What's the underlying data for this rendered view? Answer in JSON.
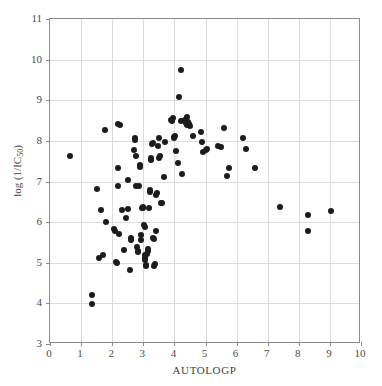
{
  "chart_data": {
    "type": "scatter",
    "title": "",
    "xlabel": "AUTOLOGP",
    "ylabel": "log (1/IC50)",
    "ylabel_base": "log (1/IC",
    "ylabel_sub": "50",
    "ylabel_close": ")",
    "xlim": [
      0,
      10
    ],
    "ylim": [
      3,
      11
    ],
    "xticks": [
      0,
      1,
      2,
      3,
      4,
      5,
      6,
      7,
      8,
      9,
      10
    ],
    "yticks": [
      3,
      4,
      5,
      6,
      7,
      8,
      9,
      10,
      11
    ],
    "xtick_labels": [
      "0",
      "1",
      "2",
      "3",
      "4",
      "5",
      "6",
      "7",
      "8",
      "9",
      "10"
    ],
    "ytick_labels": [
      "3",
      "4",
      "5",
      "6",
      "7",
      "8",
      "9",
      "10",
      "11"
    ],
    "grid": true,
    "legend": null,
    "marker": "filled-circle",
    "marker_color": "#1c1c1c",
    "marker_size": 6,
    "grid_color": "#dcdcdc",
    "frame_color": "#8c8c8c",
    "background": "#ffffff",
    "n_points": 118,
    "points": [
      [
        0.64,
        7.64
      ],
      [
        1.35,
        4.2
      ],
      [
        1.35,
        3.98
      ],
      [
        1.5,
        6.82
      ],
      [
        1.58,
        5.12
      ],
      [
        1.65,
        6.3
      ],
      [
        1.72,
        5.2
      ],
      [
        1.78,
        8.28
      ],
      [
        1.8,
        6.0
      ],
      [
        2.05,
        5.83
      ],
      [
        2.08,
        5.78
      ],
      [
        2.12,
        5.02
      ],
      [
        2.15,
        5.0
      ],
      [
        2.18,
        8.42
      ],
      [
        2.18,
        7.34
      ],
      [
        2.2,
        6.9
      ],
      [
        2.22,
        5.7
      ],
      [
        2.25,
        8.4
      ],
      [
        2.32,
        6.3
      ],
      [
        2.38,
        5.32
      ],
      [
        2.45,
        6.1
      ],
      [
        2.5,
        7.04
      ],
      [
        2.52,
        6.32
      ],
      [
        2.56,
        4.82
      ],
      [
        2.6,
        5.62
      ],
      [
        2.62,
        5.55
      ],
      [
        2.7,
        7.78
      ],
      [
        2.72,
        8.08
      ],
      [
        2.74,
        8.02
      ],
      [
        2.76,
        7.63
      ],
      [
        2.78,
        6.88
      ],
      [
        2.8,
        5.4
      ],
      [
        2.82,
        5.3
      ],
      [
        2.84,
        5.27
      ],
      [
        2.86,
        6.88
      ],
      [
        2.88,
        7.4
      ],
      [
        2.9,
        7.35
      ],
      [
        2.92,
        5.68
      ],
      [
        2.94,
        5.55
      ],
      [
        2.96,
        6.36
      ],
      [
        2.98,
        6.38
      ],
      [
        3.0,
        6.36
      ],
      [
        3.02,
        5.92
      ],
      [
        3.04,
        5.88
      ],
      [
        3.05,
        5.18
      ],
      [
        3.06,
        5.12
      ],
      [
        3.07,
        5.08
      ],
      [
        3.08,
        4.92
      ],
      [
        3.1,
        4.95
      ],
      [
        3.12,
        5.22
      ],
      [
        3.14,
        5.35
      ],
      [
        3.16,
        5.3
      ],
      [
        3.18,
        6.34
      ],
      [
        3.2,
        6.74
      ],
      [
        3.22,
        6.8
      ],
      [
        3.24,
        7.52
      ],
      [
        3.26,
        7.58
      ],
      [
        3.28,
        7.92
      ],
      [
        3.3,
        7.94
      ],
      [
        3.32,
        5.62
      ],
      [
        3.34,
        5.58
      ],
      [
        3.36,
        4.92
      ],
      [
        3.38,
        4.96
      ],
      [
        3.4,
        5.78
      ],
      [
        3.42,
        6.66
      ],
      [
        3.45,
        6.72
      ],
      [
        3.48,
        7.88
      ],
      [
        3.5,
        8.06
      ],
      [
        3.52,
        7.58
      ],
      [
        3.55,
        7.62
      ],
      [
        3.58,
        6.46
      ],
      [
        3.6,
        6.48
      ],
      [
        3.65,
        7.12
      ],
      [
        3.7,
        7.98
      ],
      [
        3.9,
        8.52
      ],
      [
        3.92,
        8.48
      ],
      [
        3.95,
        8.56
      ],
      [
        3.98,
        8.1
      ],
      [
        4.0,
        8.08
      ],
      [
        4.02,
        8.12
      ],
      [
        4.05,
        7.74
      ],
      [
        4.1,
        7.46
      ],
      [
        4.15,
        9.08
      ],
      [
        4.2,
        9.75
      ],
      [
        4.22,
        8.5
      ],
      [
        4.25,
        7.18
      ],
      [
        4.35,
        8.52
      ],
      [
        4.38,
        8.44
      ],
      [
        4.4,
        8.58
      ],
      [
        4.42,
        8.4
      ],
      [
        4.44,
        8.46
      ],
      [
        4.46,
        8.38
      ],
      [
        4.48,
        8.42
      ],
      [
        4.5,
        8.36
      ],
      [
        4.6,
        8.12
      ],
      [
        4.85,
        8.22
      ],
      [
        4.9,
        7.98
      ],
      [
        4.92,
        7.72
      ],
      [
        5.0,
        7.78
      ],
      [
        5.05,
        7.8
      ],
      [
        5.4,
        7.88
      ],
      [
        5.5,
        7.86
      ],
      [
        5.6,
        8.32
      ],
      [
        5.7,
        7.14
      ],
      [
        5.75,
        7.34
      ],
      [
        6.22,
        8.06
      ],
      [
        6.3,
        7.8
      ],
      [
        6.6,
        7.34
      ],
      [
        7.4,
        6.38
      ],
      [
        8.28,
        6.17
      ],
      [
        8.3,
        5.78
      ],
      [
        9.05,
        6.27
      ]
    ]
  }
}
